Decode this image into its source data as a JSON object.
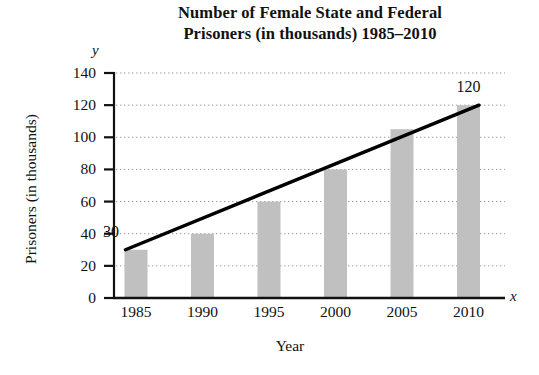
{
  "chart_data": {
    "type": "bar",
    "title": "Number of Female State and Federal Prisoners (in thousands) 1985–2010",
    "title_line1": "Number of Female State and Federal",
    "title_line2": "Prisoners (in thousands) 1985–2010",
    "xlabel": "Year",
    "ylabel": "Prisoners (in thousands)",
    "x_axis_letter": "x",
    "y_axis_letter": "y",
    "categories": [
      "1985",
      "1990",
      "1995",
      "2000",
      "2005",
      "2010"
    ],
    "values": [
      30,
      40,
      60,
      80,
      105,
      120
    ],
    "ylim": [
      0,
      140
    ],
    "ytick_labels": [
      "0",
      "20",
      "40",
      "60",
      "80",
      "100",
      "120",
      "140"
    ],
    "ytick_values": [
      0,
      20,
      40,
      60,
      80,
      100,
      120,
      140
    ],
    "grid": "horizontal-dotted",
    "legend": "none",
    "bar_color": "#c0c0c0",
    "axis_color": "#111111",
    "trendline_color": "#000000",
    "annotations": [
      {
        "label": "30",
        "x": "1985",
        "y": 30
      },
      {
        "label": "120",
        "x": "2010",
        "y": 120
      }
    ],
    "series": [
      {
        "name": "Prisoners (in thousands)",
        "type": "bar",
        "values": [
          30,
          40,
          60,
          80,
          105,
          120
        ]
      },
      {
        "name": "Trend line",
        "type": "line",
        "points": [
          {
            "x": "1985",
            "y": 30
          },
          {
            "x": "2010",
            "y": 120
          }
        ]
      }
    ]
  }
}
